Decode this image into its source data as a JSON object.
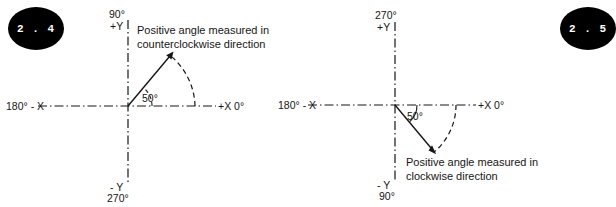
{
  "page": {
    "background": "#ffffff",
    "ink": "#161616",
    "width": 552,
    "height": 207
  },
  "figures": [
    {
      "id": "2.4",
      "badge_label": "2 . 4",
      "badge_color": "#000000",
      "badge_text_color": "#ffffff",
      "axes": {
        "y_positive_top": "90°",
        "y_positive_name": "+Y",
        "y_negative_name": "- Y",
        "y_negative_bottom": "270°",
        "x_negative": "180° - X",
        "x_positive": "+X 0°"
      },
      "angle": {
        "value": 50,
        "label": "50°",
        "direction": "counterclockwise",
        "start_deg": 0,
        "end_deg": 50
      },
      "caption": "Positive angle measured in counterclockwise direction"
    },
    {
      "id": "2.5",
      "badge_label": "2 . 5",
      "badge_color": "#000000",
      "badge_text_color": "#ffffff",
      "axes": {
        "y_positive_top": "270°",
        "y_positive_name": "+Y",
        "y_negative_name": "- Y",
        "y_negative_bottom": "90°",
        "x_negative": "180° - X",
        "x_positive": "+X  0°"
      },
      "angle": {
        "value": 50,
        "label": "50°",
        "direction": "clockwise",
        "start_deg": 0,
        "end_deg": -50
      },
      "caption": "Positive angle measured in clockwise direction"
    }
  ]
}
